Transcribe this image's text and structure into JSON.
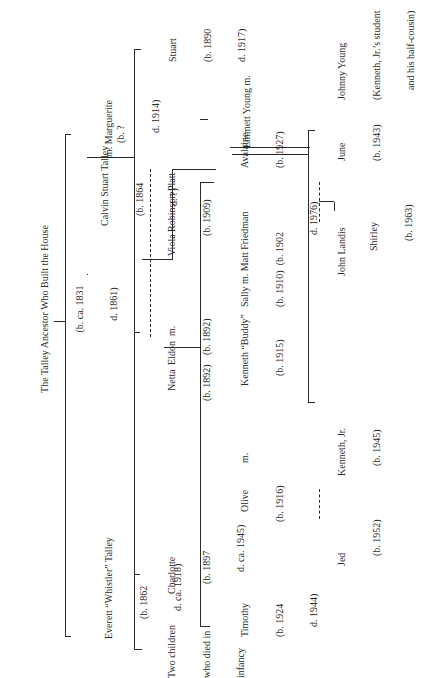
{
  "title": "The Talley Ancestor Who Built the House",
  "ancestor": {
    "name": "The Talley Ancestor Who Built the House",
    "born": "(b. ca. 1831",
    "died": "d. 1861)"
  },
  "generation1": {
    "calvin": {
      "name": "Calvin Stuart Talley",
      "born": "(b. 1864",
      "died": "d. ?)"
    },
    "marguerite": {
      "prefix": "m.",
      "name": "Marguerite",
      "born": "(b. ?",
      "died": "d. 1914)"
    },
    "everett": {
      "name": "Everett “Whistler” Talley",
      "born": "(b. 1862",
      "died": "d. ca. 1918)"
    }
  },
  "generation2": {
    "stuart": {
      "name": "Stuart",
      "born": "(b. 1890",
      "died": "d. 1917)"
    },
    "viola": {
      "name": "Viola Robinson Platt",
      "born": "(b. 1909)"
    },
    "eldon": {
      "name": "Eldon",
      "marriage": "m.",
      "born": "(b. 1892)"
    },
    "netta": {
      "name": "Netta",
      "born": "(b. 1892)"
    },
    "charlotte": {
      "name": "Charlotte",
      "born": "(b. 1897",
      "died": "d. ca. 1945)"
    },
    "infants": {
      "line1": "Two children",
      "line2": "who died in",
      "line3": "infancy"
    }
  },
  "generation3": {
    "emmett": {
      "name": "Emmett Young m."
    },
    "avalaine": {
      "name": "Avalaine",
      "born": "(b. 1927)"
    },
    "sally": {
      "name": "Sally m. Matt Friedman",
      "born": "(b. 1910)",
      "matt_born": "(b. 1902",
      "matt_died": "d. 1976)"
    },
    "kenneth": {
      "name": "Kenneth “Buddy”",
      "born": "(b. 1915)"
    },
    "marriage": "m.",
    "olive": {
      "name": "Olive",
      "born": "(b. 1916)"
    },
    "timothy": {
      "name": "Timothy",
      "born": "(b. 1924",
      "died": "d. 1944)"
    }
  },
  "generation4": {
    "johnny": {
      "name": "Johnny Young",
      "note1": "(Kenneth, Jr.’s student",
      "note2": "and his half-cousin)"
    },
    "june": {
      "name": "June",
      "born": "(b. 1943)"
    },
    "john_landis": {
      "name": "John Landis"
    },
    "kenneth_jr": {
      "name": "Kenneth, Jr.",
      "born": "(b. 1945)"
    },
    "jed": {
      "name": "Jed",
      "born": "(b. 1952)"
    }
  },
  "generation5": {
    "shirley": {
      "name": "Shirley",
      "born": "(b. 1963)"
    }
  }
}
